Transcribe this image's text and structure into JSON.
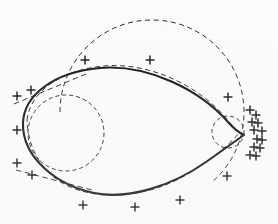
{
  "figure": {
    "caption": "",
    "width": 278,
    "height": 224,
    "background_color": "#fbfbfa",
    "ink_color": "#18181a"
  },
  "chart_data": {
    "type": "scatter",
    "subtitle": "",
    "xlabel": "",
    "ylabel": "",
    "xlim": [
      0,
      278
    ],
    "ylim": [
      224,
      0
    ],
    "grid": false,
    "legend_position": "none",
    "legend_entries": [],
    "tick_labels_x": [],
    "tick_labels_y": [],
    "annotations": [],
    "series": [
      {
        "name": "measured-points",
        "marker": "plus",
        "marker_color": "#141416",
        "marker_size": 9,
        "points": [
          [
            85,
            60
          ],
          [
            150,
            60
          ],
          [
            31,
            90
          ],
          [
            17,
            96
          ],
          [
            17,
            130
          ],
          [
            17,
            163
          ],
          [
            32,
            175
          ],
          [
            83,
            205
          ],
          [
            135,
            207
          ],
          [
            180,
            200
          ],
          [
            228,
            97
          ],
          [
            250,
            110
          ],
          [
            256,
            115
          ],
          [
            252,
            122
          ],
          [
            258,
            123
          ],
          [
            254,
            130
          ],
          [
            262,
            131
          ],
          [
            257,
            139
          ],
          [
            262,
            140
          ],
          [
            254,
            147
          ],
          [
            260,
            148
          ],
          [
            250,
            155
          ],
          [
            256,
            156
          ],
          [
            227,
            176
          ]
        ]
      }
    ],
    "curves": [
      {
        "name": "solid-ovoid-curve",
        "style": "solid",
        "stroke": "#18181a",
        "stroke_width": 2.1,
        "description": "Main heavy closed ovoid with a sharp cusp at right"
      },
      {
        "name": "fitted-dashed-curve",
        "style": "dashed",
        "stroke": "#2b2b2e",
        "stroke_width": 1.0,
        "description": "Thin dashed curve closely tracking the solid ovoid"
      },
      {
        "name": "large-dashed-circle",
        "style": "dashed",
        "stroke": "#2d2d30",
        "stroke_width": 1.0,
        "description": "Large dashed circle arcing over the upper half",
        "center": [
          152,
          112
        ],
        "radius": 92
      },
      {
        "name": "inner-dashed-circle",
        "style": "dashed",
        "stroke": "#2d2d30",
        "stroke_width": 1.0,
        "description": "Small dashed circle inside the left lobe",
        "center": [
          66,
          133
        ],
        "radius": 38
      },
      {
        "name": "cusp-dashed-circle",
        "style": "dashed",
        "stroke": "#2d2d30",
        "stroke_width": 1.0,
        "description": "Tiny dashed circle tucked at the right cusp",
        "center": [
          228,
          132
        ],
        "radius": 16
      },
      {
        "name": "upper-left-tangent-line",
        "style": "dashed",
        "stroke": "#2d2d30",
        "stroke_width": 1.0,
        "description": "Straight dashed tangent at the upper-left"
      },
      {
        "name": "lower-left-tangent-line",
        "style": "dashed",
        "stroke": "#2d2d30",
        "stroke_width": 1.0,
        "description": "Straight dashed tangent at the lower-left"
      }
    ]
  }
}
